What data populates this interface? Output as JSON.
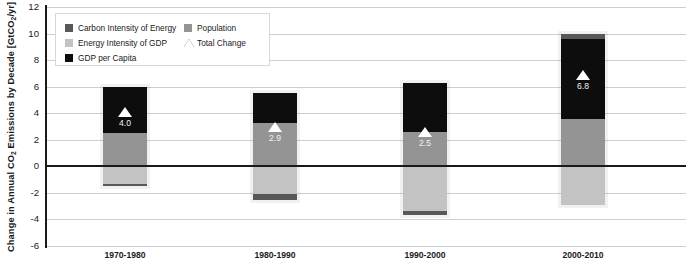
{
  "chart_data": {
    "type": "bar",
    "title": "",
    "xlabel": "",
    "ylabel": "Change in Annual CO2 Emissions by Decade [GtCO2/yr]",
    "ylabel_parts": {
      "a": "Change in Annual CO",
      "sub1": "2",
      "b": " Emissions by Decade [GtCO",
      "sub2": "2",
      "c": "/yr]"
    },
    "categories": [
      "1970-1980",
      "1980-1990",
      "1990-2000",
      "2000-2010"
    ],
    "ylim": [
      -6,
      12
    ],
    "yticks": [
      12,
      10,
      8,
      6,
      4,
      2,
      0,
      -2,
      -4,
      -6
    ],
    "ytick_labels": [
      "12",
      "10",
      "8",
      "6",
      "4",
      "2",
      "0",
      "-2",
      "-4",
      "-6"
    ],
    "grid": true,
    "stacked": true,
    "legend_position": "top-left-inside",
    "series": [
      {
        "name": "Carbon Intensity of Energy",
        "color": "#58585a",
        "values": [
          -0.2,
          -0.4,
          -0.3,
          0.4
        ]
      },
      {
        "name": "Energy Intensity of GDP",
        "color": "#c3c3c3",
        "values": [
          -1.3,
          -2.1,
          -3.4,
          -2.9
        ]
      },
      {
        "name": "GDP per Capita",
        "color": "#0d0d0d",
        "values": [
          3.5,
          2.2,
          3.7,
          6.0
        ]
      },
      {
        "name": "Population",
        "color": "#949494",
        "values": [
          2.5,
          3.3,
          2.6,
          3.6
        ]
      }
    ],
    "total_change": {
      "name": "Total Change",
      "marker": "triangle",
      "marker_color": "#ffffff",
      "values": [
        4.0,
        2.9,
        2.5,
        6.8
      ],
      "labels": [
        "4.0",
        "2.9",
        "2.5",
        "6.8"
      ]
    }
  },
  "legend": {
    "items": [
      {
        "label": "Carbon Intensity of Energy",
        "swatch": "square",
        "color": "#58585a"
      },
      {
        "label": "Energy Intensity of GDP",
        "swatch": "square",
        "color": "#c3c3c3"
      },
      {
        "label": "GDP per Capita",
        "swatch": "square",
        "color": "#0d0d0d"
      },
      {
        "label": "Population",
        "swatch": "square",
        "color": "#949494"
      },
      {
        "label": "Total Change",
        "swatch": "triangle",
        "color": "#2b2b2b"
      }
    ]
  },
  "colors": {
    "axis": "#1a1a1a",
    "grid": "#c9cfd6",
    "background": "#ffffff"
  }
}
